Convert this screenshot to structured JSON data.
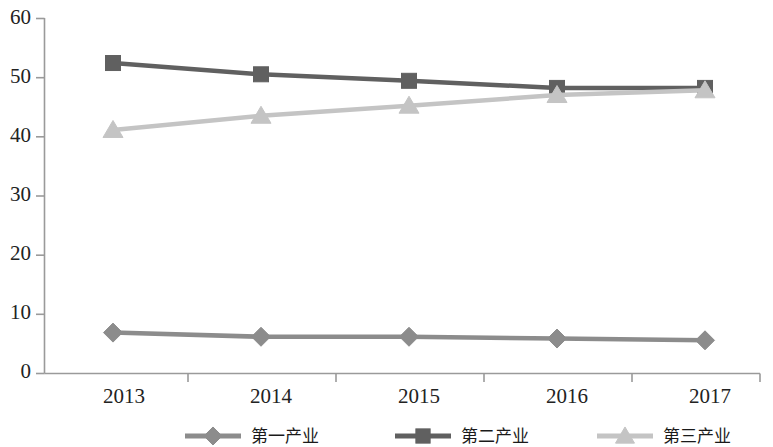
{
  "chart_data": {
    "type": "line",
    "title": "",
    "subtitle": "",
    "xlabel": "",
    "ylabel": "",
    "categories": [
      "2013",
      "2014",
      "2015",
      "2016",
      "2017"
    ],
    "series": [
      {
        "name": "第一产业",
        "values": [
          6.9,
          6.2,
          6.2,
          5.9,
          5.6
        ],
        "color": "#8c8c8c",
        "marker": "diamond"
      },
      {
        "name": "第二产业",
        "values": [
          52.4,
          50.5,
          49.4,
          48.2,
          48.2
        ],
        "color": "#606060",
        "marker": "square"
      },
      {
        "name": "第三产业",
        "values": [
          41.1,
          43.5,
          45.2,
          47.0,
          47.8
        ],
        "color": "#c4c4c4",
        "marker": "triangle"
      }
    ],
    "ylim": [
      0,
      60
    ],
    "yticks": [
      "0",
      "10",
      "20",
      "30",
      "40",
      "50",
      "60"
    ],
    "xticks": [
      "2013",
      "2014",
      "2015",
      "2016",
      "2017"
    ],
    "grid": false,
    "legend_position": "bottom"
  },
  "axis": {
    "y_ticks": [
      "60",
      "50",
      "40",
      "30",
      "20",
      "10",
      "0"
    ],
    "x_ticks": [
      "2013",
      "2014",
      "2015",
      "2016",
      "2017"
    ]
  },
  "legend": {
    "items": [
      {
        "label": "第一产业",
        "color": "#8c8c8c",
        "marker": "diamond"
      },
      {
        "label": "第二产业",
        "color": "#606060",
        "marker": "square"
      },
      {
        "label": "第三产业",
        "color": "#c4c4c4",
        "marker": "triangle"
      }
    ]
  }
}
